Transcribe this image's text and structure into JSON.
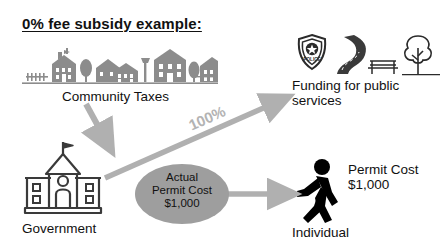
{
  "title": "0% fee subsidy example:",
  "nodes": {
    "community": {
      "label": "Community Taxes",
      "icon": "houses-skyline-icon"
    },
    "funding": {
      "label": "Funding for public\nservices",
      "line1": "Funding for public",
      "line2": "services",
      "icons": [
        "police-badge-icon",
        "road-icon",
        "bench-icon",
        "tree-icon"
      ],
      "badge_text": "POLICE"
    },
    "government": {
      "label": "Government",
      "icon": "government-building-icon"
    },
    "individual": {
      "label": "Individual",
      "icon": "walking-person-icon"
    }
  },
  "callouts": {
    "actual_permit_cost": {
      "line1": "Actual",
      "line2": "Permit Cost",
      "line3": "$1,000"
    },
    "individual_permit_cost": {
      "line1": "Permit Cost",
      "line2": "$1,000"
    }
  },
  "flows": {
    "taxes_to_government": {
      "label": "",
      "from": "community",
      "to": "government"
    },
    "government_to_funding": {
      "label": "100%",
      "from": "government",
      "to": "funding"
    },
    "cost_to_individual": {
      "label": "",
      "from": "actual-permit-cost",
      "to": "individual"
    }
  },
  "colors": {
    "arrow_gray": "#b0b0b0",
    "ellipse_fill": "#9e9e9e",
    "silhouette_gray": "#8c8c8c",
    "line_art": "#3a3a3a",
    "black": "#000000",
    "background": "#ffffff"
  }
}
